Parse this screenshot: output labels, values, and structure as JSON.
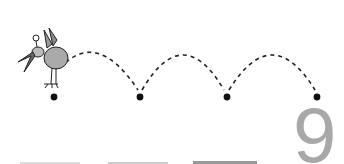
{
  "worksheet": {
    "numeral": "9",
    "numeral_color": "#a8a8a8",
    "dots": [
      {
        "x": 54,
        "y": 97
      },
      {
        "x": 140,
        "y": 97
      },
      {
        "x": 227,
        "y": 97
      },
      {
        "x": 317,
        "y": 97
      }
    ],
    "character": "bird-icon",
    "path_style": "dashed-arcs"
  }
}
